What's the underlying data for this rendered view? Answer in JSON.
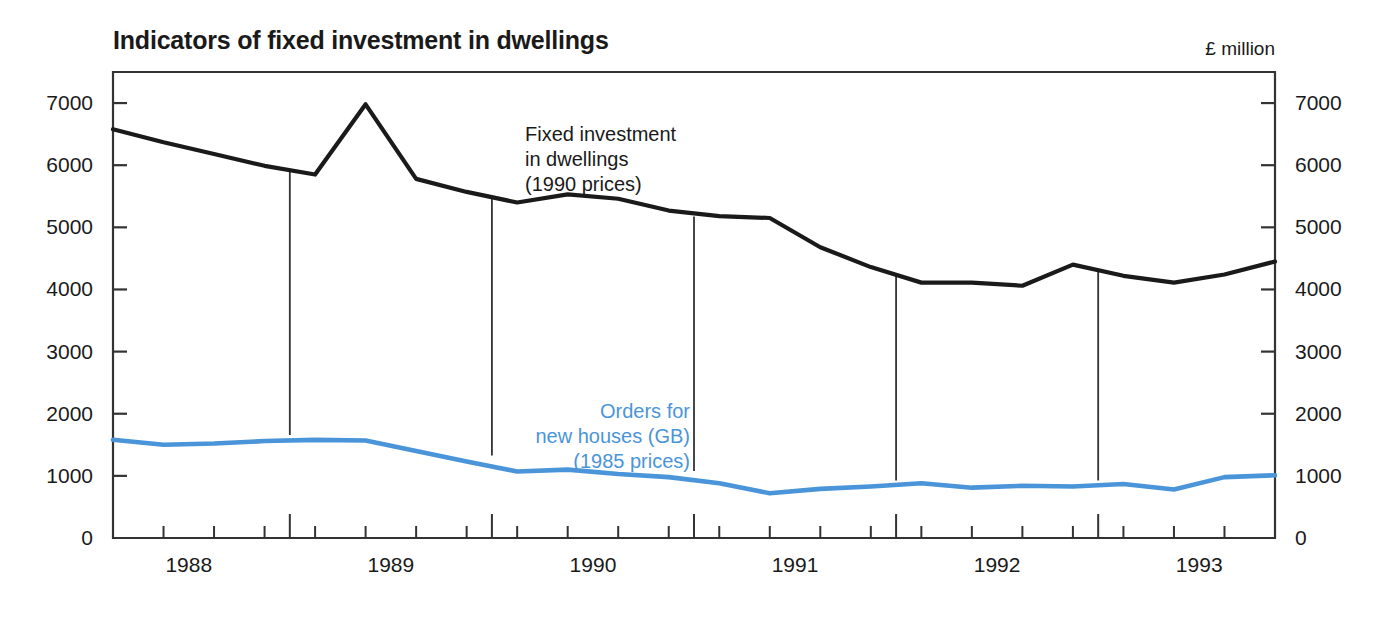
{
  "header": {
    "title": "Indicators of fixed investment in dwellings",
    "unit": "£ million"
  },
  "annotations": {
    "black": {
      "line1": "Fixed investment",
      "line2": "in dwellings",
      "line3": "(1990 prices)"
    },
    "blue": {
      "line1": "Orders for",
      "line2": "new houses (GB)",
      "line3": "(1985 prices)"
    }
  },
  "colors": {
    "series_black": "#1a1a1a",
    "series_blue": "#4a95d9",
    "axis": "#333333",
    "background": "#ffffff"
  },
  "chart_data": {
    "type": "line",
    "title": "Indicators of fixed investment in dwellings",
    "subtitle": "",
    "xlabel": "",
    "ylabel": "£ million",
    "ylim": [
      0,
      7500
    ],
    "yticks": [
      0,
      1000,
      2000,
      3000,
      4000,
      5000,
      6000,
      7000
    ],
    "ytick_labels": [
      "0",
      "1000",
      "2000",
      "3000",
      "4000",
      "5000",
      "6000",
      "7000"
    ],
    "right_axis_mirrored": true,
    "grid": false,
    "legend_position": "inline-annotation",
    "xlim": [
      1987.625,
      1993.375
    ],
    "xticks_major": [
      1988.5,
      1989.5,
      1990.5,
      1991.5,
      1992.5
    ],
    "xtick_year_labels": [
      "1988",
      "1989",
      "1990",
      "1991",
      "1992",
      "1993"
    ],
    "xtick_year_positions": [
      1988.0,
      1989.0,
      1990.0,
      1991.0,
      1992.0,
      1993.0
    ],
    "x_quarters": [
      1987.625,
      1987.875,
      1988.125,
      1988.375,
      1988.625,
      1988.875,
      1989.125,
      1989.375,
      1989.625,
      1989.875,
      1990.125,
      1990.375,
      1990.625,
      1990.875,
      1991.125,
      1991.375,
      1991.625,
      1991.875,
      1992.125,
      1992.375,
      1992.625,
      1992.875,
      1993.125,
      1993.375
    ],
    "series": [
      {
        "name": "Fixed investment in dwellings (1990 prices)",
        "color": "#1a1a1a",
        "values": [
          6580,
          6370,
          6180,
          5990,
          5850,
          6980,
          5780,
          5570,
          5400,
          5530,
          5460,
          5270,
          5180,
          5150,
          4680,
          4360,
          4110,
          4110,
          4060,
          4400,
          4220,
          4110,
          4240,
          4450
        ]
      },
      {
        "name": "Orders for new houses (GB) (1985 prices)",
        "color": "#4a95d9",
        "values": [
          1580,
          1500,
          1520,
          1560,
          1580,
          1570,
          1400,
          1230,
          1070,
          1100,
          1030,
          980,
          880,
          720,
          790,
          830,
          880,
          810,
          840,
          830,
          870,
          780,
          980,
          1010
        ]
      }
    ],
    "vertical_dividers": [
      1988.5,
      1989.5,
      1990.5,
      1991.5,
      1992.5
    ]
  }
}
